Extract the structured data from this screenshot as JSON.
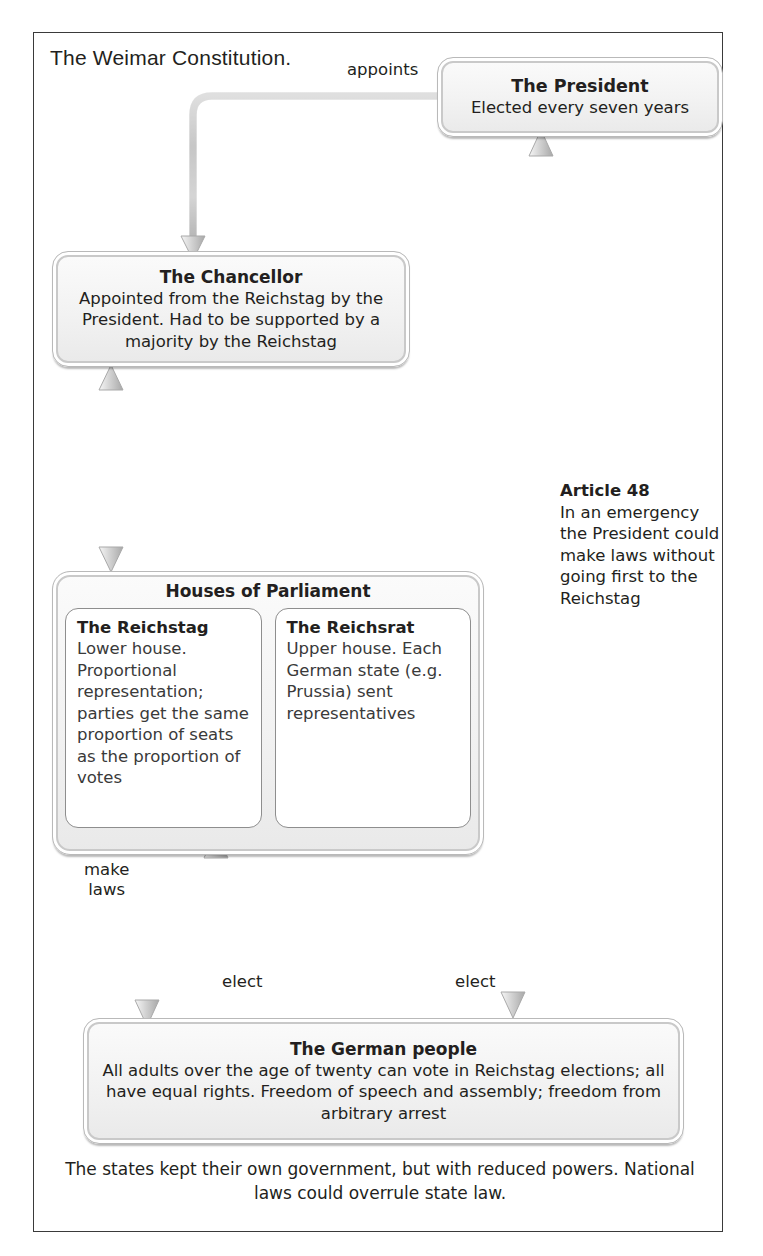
{
  "diagram": {
    "title": "The Weimar Constitution.",
    "caption": "The states kept their own government, but with reduced powers. National laws could overrule state law."
  },
  "nodes": {
    "president": {
      "heading": "The President",
      "body": "Elected every seven years"
    },
    "chancellor": {
      "heading": "The Chancellor",
      "body": "Appointed from the Reichstag by the President. Had to be supported by a majority by the Reichstag"
    },
    "parliament": {
      "heading": "Houses of Parliament",
      "houses": [
        {
          "name": "The Reichstag",
          "text": "Lower house. Proportional representation; parties get the same proportion of seats as the proportion of votes"
        },
        {
          "name": "The Reichsrat",
          "text": "Upper house. Each German state (e.g. Prussia) sent representatives"
        }
      ]
    },
    "people": {
      "heading": "The German people",
      "body": "All adults over the age of twenty can vote in Reichstag elections; all have equal rights. Freedom of speech and assembly; freedom from arbitrary arrest"
    }
  },
  "annotations": {
    "article48": {
      "title": "Article 48",
      "text": "In an emergency the President could make laws without going first to the Reichstag"
    }
  },
  "edges": {
    "appoints": "appoints",
    "make_laws": "make\nlaws",
    "elect_reichstag": "elect",
    "elect_president": "elect"
  },
  "colors": {
    "frame_border": "#3a3a3a",
    "node_fill": "#f2f2f2",
    "node_border": "#c9c9c9",
    "arrow": "#c6c6c6",
    "text": "#231f20"
  }
}
